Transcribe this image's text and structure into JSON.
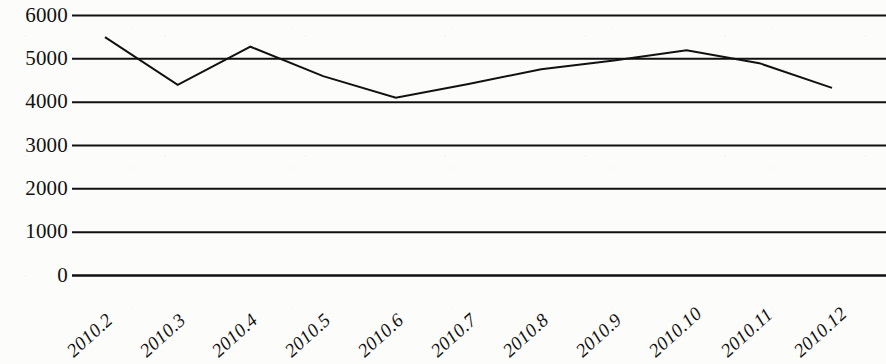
{
  "chart_data": {
    "type": "line",
    "title": "",
    "subtitle": "",
    "xlabel": "",
    "ylabel": "",
    "categories": [
      "2010.2",
      "2010.3",
      "2010.4",
      "2010.5",
      "2010.6",
      "2010.7",
      "2010.8",
      "2010.9",
      "2010.10",
      "2010.11",
      "2010.12"
    ],
    "values": [
      5500,
      4400,
      5280,
      4600,
      4100,
      4420,
      4760,
      4960,
      5200,
      4900,
      4330
    ],
    "series": [
      {
        "name": "",
        "values": [
          5500,
          4400,
          5280,
          4600,
          4100,
          4420,
          4760,
          4960,
          5200,
          4900,
          4330
        ]
      }
    ],
    "ylim": [
      0,
      6000
    ],
    "yticks": [
      0,
      1000,
      2000,
      3000,
      4000,
      5000,
      6000
    ],
    "ytick_labels": [
      "0",
      "1000",
      "2000",
      "3000",
      "4000",
      "5000",
      "6000"
    ],
    "grid": true,
    "grid_axis": "y",
    "legend": false,
    "legend_position": "none",
    "line_color": "#111111",
    "line_width": 2,
    "markers": false,
    "background_color": "#fcfcfa",
    "axis_color": "#111111"
  }
}
